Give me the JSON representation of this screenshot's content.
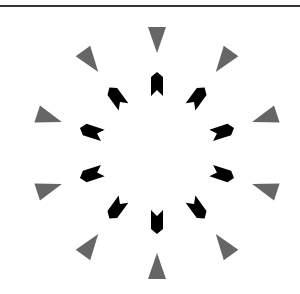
{
  "figure": {
    "center": [
      157,
      153
    ],
    "outer_ring": {
      "count": 10,
      "radius": 113,
      "shape": "triangle",
      "direction": "inward",
      "color": "#666666"
    },
    "inner_ring": {
      "count": 10,
      "radius": 69,
      "shape": "chevron-arrow",
      "direction": "outward",
      "color": "#000000"
    },
    "border_color": "#333333"
  }
}
